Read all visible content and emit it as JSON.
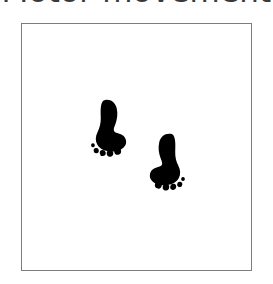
{
  "caption": {
    "text": "Motor movement",
    "color": "#3a3a3a",
    "clipped": true
  },
  "panel": {
    "name": "footprint-figure-panel",
    "background": "#ffffff",
    "border_color": "#7d7d7d",
    "border_width_px": 1,
    "x": 21,
    "y": 23,
    "width": 231,
    "height": 248
  },
  "figure": {
    "ink_color": "#000000",
    "footprints": [
      {
        "id": "left-foot",
        "label": "Left footprint",
        "side": "left",
        "order": 1,
        "toe_count": 5,
        "bbox": {
          "x": 88,
          "y": 99,
          "width": 35,
          "height": 51
        },
        "rotation_deg": -8
      },
      {
        "id": "right-foot",
        "label": "Right footprint",
        "side": "right",
        "order": 2,
        "toe_count": 5,
        "bbox": {
          "x": 150,
          "y": 133,
          "width": 38,
          "height": 52
        },
        "rotation_deg": 8
      }
    ]
  }
}
